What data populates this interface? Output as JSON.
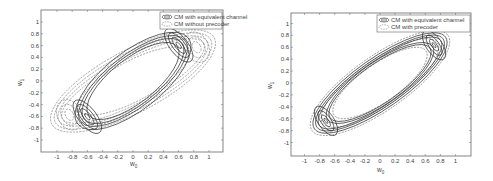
{
  "chart_data": [
    {
      "type": "contour",
      "title": "",
      "xlabel": "w0",
      "ylabel": "w1",
      "xlim": [
        -1.2,
        1.2
      ],
      "ylim": [
        -1.2,
        1.2
      ],
      "x_ticks": [
        "-1",
        "-0.8",
        "-0.6",
        "-0.4",
        "-0.2",
        "0",
        "0.2",
        "0.4",
        "0.6",
        "0.8",
        "1"
      ],
      "y_ticks": [
        "1",
        "0.8",
        "0.6",
        "0.4",
        "0.2",
        "0",
        "-0.2",
        "-0.4",
        "-0.6",
        "-0.8",
        "-1"
      ],
      "grid": false,
      "legend_position": "upper right",
      "series": [
        {
          "name": "CM with equivalent channel",
          "style": "solid",
          "minima": [
            [
              -0.65,
              0.4
            ],
            [
              0.65,
              -0.4
            ]
          ]
        },
        {
          "name": "CM without precoder",
          "style": "dashed",
          "minima": [
            [
              -0.85,
              0.38
            ],
            [
              0.85,
              -0.38
            ]
          ]
        }
      ]
    },
    {
      "type": "contour",
      "title": "",
      "xlabel": "w0",
      "ylabel": "w1",
      "xlim": [
        -1.2,
        1.2
      ],
      "ylim": [
        -1.2,
        1.2
      ],
      "x_ticks": [
        "-1",
        "-0.8",
        "-0.6",
        "-0.4",
        "-0.2",
        "0",
        "0.2",
        "0.4",
        "0.6",
        "0.8",
        "1"
      ],
      "y_ticks": [
        "1",
        "0.8",
        "0.6",
        "0.4",
        "0.2",
        "0",
        "-0.2",
        "-0.4",
        "-0.6",
        "-0.8",
        "-1"
      ],
      "grid": false,
      "legend_position": "upper right",
      "series": [
        {
          "name": "CM with equivalent channel",
          "style": "solid",
          "minima": [
            [
              -0.65,
              0.38
            ],
            [
              0.65,
              -0.38
            ]
          ]
        },
        {
          "name": "CM with precoder",
          "style": "dashed",
          "minima": [
            [
              -0.65,
              0.38
            ],
            [
              0.65,
              -0.38
            ]
          ]
        }
      ]
    }
  ],
  "left": {
    "legend": [
      "CM with equivalent channel",
      "CM without precoder"
    ],
    "xlabel_main": "w",
    "xlabel_sub": "0",
    "ylabel_main": "w",
    "ylabel_sub": "1"
  },
  "right": {
    "legend": [
      "CM with equivalent channel",
      "CM with precoder"
    ],
    "xlabel_main": "w",
    "xlabel_sub": "0",
    "ylabel_main": "w",
    "ylabel_sub": "1"
  }
}
